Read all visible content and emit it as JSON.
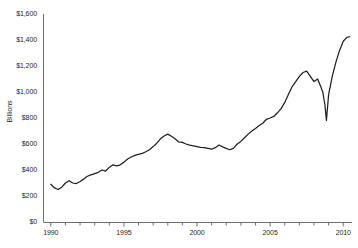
{
  "chart_data": {
    "type": "line",
    "title": "",
    "subtitle": "",
    "xlabel": "",
    "ylabel": "Billions",
    "xlim": [
      1989.5,
      2010.6
    ],
    "ylim": [
      0,
      1600
    ],
    "ytick_values": [
      0,
      200,
      400,
      600,
      800,
      1000,
      1200,
      1400,
      1600
    ],
    "ytick_labels": [
      "$0",
      "$200",
      "$400",
      "$600",
      "$800",
      "$1,000",
      "$1,200",
      "$1,400",
      "$1,600"
    ],
    "xtick_labels": [
      "1990",
      "1995",
      "2000",
      "2005",
      "2010"
    ],
    "xtick_values": [
      1990,
      1995,
      2000,
      2005,
      2010
    ],
    "x_minor_tick_step": 1,
    "grid": false,
    "legend": null,
    "line_color": "#231f20",
    "series": [
      {
        "name": "Value",
        "x": [
          1990.0,
          1990.25,
          1990.5,
          1990.75,
          1991.0,
          1991.25,
          1991.5,
          1991.75,
          1992.0,
          1992.25,
          1992.5,
          1992.75,
          1993.0,
          1993.25,
          1993.5,
          1993.75,
          1994.0,
          1994.25,
          1994.5,
          1994.75,
          1995.0,
          1995.25,
          1995.5,
          1995.75,
          1996.0,
          1996.25,
          1996.5,
          1996.75,
          1997.0,
          1997.25,
          1997.5,
          1997.75,
          1998.0,
          1998.25,
          1998.5,
          1998.75,
          1999.0,
          1999.25,
          1999.5,
          1999.75,
          2000.0,
          2000.25,
          2000.5,
          2000.75,
          2001.0,
          2001.25,
          2001.5,
          2001.75,
          2002.0,
          2002.25,
          2002.5,
          2002.75,
          2003.0,
          2003.25,
          2003.5,
          2003.75,
          2004.0,
          2004.25,
          2004.5,
          2004.75,
          2005.0,
          2005.25,
          2005.5,
          2005.75,
          2006.0,
          2006.25,
          2006.5,
          2006.75,
          2007.0,
          2007.25,
          2007.5,
          2007.75,
          2008.0,
          2008.25,
          2008.5,
          2008.6,
          2008.75,
          2008.85,
          2009.0,
          2009.25,
          2009.5,
          2009.75,
          2010.0,
          2010.25,
          2010.45
        ],
        "values": [
          290,
          262,
          250,
          268,
          300,
          318,
          300,
          296,
          312,
          330,
          352,
          362,
          372,
          382,
          400,
          392,
          420,
          440,
          432,
          440,
          460,
          484,
          500,
          512,
          520,
          528,
          540,
          556,
          580,
          606,
          640,
          662,
          676,
          660,
          640,
          616,
          612,
          600,
          592,
          586,
          580,
          574,
          572,
          566,
          560,
          572,
          592,
          578,
          566,
          556,
          568,
          600,
          620,
          648,
          676,
          700,
          720,
          742,
          760,
          790,
          800,
          812,
          840,
          872,
          920,
          980,
          1040,
          1080,
          1120,
          1150,
          1160,
          1120,
          1080,
          1100,
          1030,
          1000,
          900,
          782,
          980,
          1120,
          1230,
          1320,
          1390,
          1420,
          1425
        ]
      }
    ]
  },
  "axis": {
    "y_axis_name": "y-axis",
    "x_axis_name": "x-axis"
  }
}
